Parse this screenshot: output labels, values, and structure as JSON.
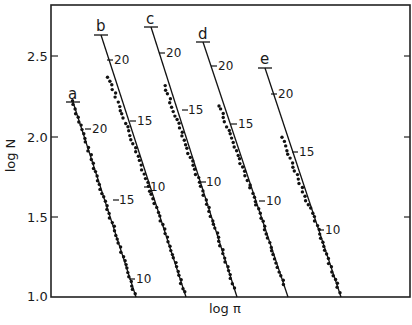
{
  "chart_data": {
    "type": "scatter",
    "title": "",
    "xlabel": "log π",
    "ylabel": "log N",
    "ylim": [
      1.0,
      2.78
    ],
    "y_ticks": [
      "1.0",
      "1.5",
      "2.0",
      "2.5"
    ],
    "x_ticks": [],
    "grid": false,
    "legend": "none — curves labeled inline a–e",
    "annotations": "Each curve has a fitted straight line with inline tick marks labeled 20, 15, 10 (a secondary scale along the line)",
    "series": [
      {
        "name": "a",
        "line": {
          "y_start": 2.22,
          "y_end": 1.0
        },
        "line_ticks": [
          {
            "label": "20",
            "y": 2.04
          },
          {
            "label": "15",
            "y": 1.6
          },
          {
            "label": "10",
            "y": 1.11
          }
        ],
        "points_y_range": [
          1.02,
          2.22
        ]
      },
      {
        "name": "b",
        "line": {
          "y_start": 2.63,
          "y_end": 1.0
        },
        "line_ticks": [
          {
            "label": "20",
            "y": 2.47
          },
          {
            "label": "15",
            "y": 2.1
          },
          {
            "label": "10",
            "y": 1.69
          }
        ],
        "points_y_range": [
          1.03,
          2.37
        ]
      },
      {
        "name": "c",
        "line": {
          "y_start": 2.68,
          "y_end": 1.0
        },
        "line_ticks": [
          {
            "label": "20",
            "y": 2.52
          },
          {
            "label": "15",
            "y": 2.15
          },
          {
            "label": "10",
            "y": 1.72
          }
        ],
        "points_y_range": [
          1.06,
          2.31
        ]
      },
      {
        "name": "d",
        "line": {
          "y_start": 2.59,
          "y_end": 1.0
        },
        "line_ticks": [
          {
            "label": "20",
            "y": 2.43
          },
          {
            "label": "15",
            "y": 2.07
          },
          {
            "label": "10",
            "y": 1.62
          }
        ],
        "points_y_range": [
          1.08,
          2.19
        ]
      },
      {
        "name": "e",
        "line": {
          "y_start": 2.42,
          "y_end": 1.0
        },
        "line_ticks": [
          {
            "label": "20",
            "y": 2.24
          },
          {
            "label": "15",
            "y": 1.87
          },
          {
            "label": "10",
            "y": 1.44
          }
        ],
        "points_y_range": [
          1.03,
          1.99
        ]
      }
    ]
  },
  "axes": {
    "xlabel": "log π",
    "ylabel": "log N",
    "y_tick_labels": [
      "2.5",
      "2.0",
      "1.5",
      "1.0"
    ]
  },
  "curve_labels": [
    "a",
    "b",
    "c",
    "d",
    "e"
  ],
  "line_tick_labels": {
    "a": [
      "20",
      "15",
      "10"
    ],
    "b": [
      "20",
      "15",
      "10"
    ],
    "c": [
      "20",
      "15",
      "10"
    ],
    "d": [
      "20",
      "15",
      "10"
    ],
    "e": [
      "20",
      "15",
      "10"
    ]
  }
}
